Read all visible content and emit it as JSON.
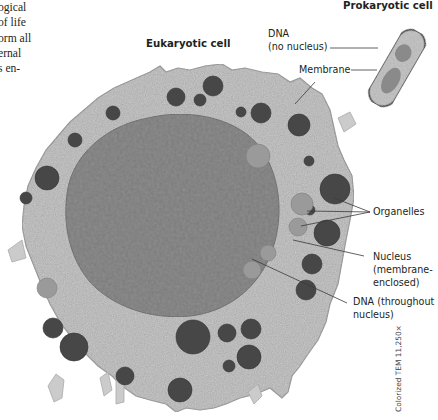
{
  "figure": {
    "body_text_lines": [
      "ogical",
      "of life",
      "orm all",
      "ernal",
      "s en-"
    ],
    "footer_fragment": "t ll   l",
    "titles": {
      "eukaryotic": "Eukaryotic cell",
      "prokaryotic": "Prokaryotic cell"
    },
    "labels": {
      "dna_prokaryote_line1": "DNA",
      "dna_prokaryote_line2": "(no nucleus)",
      "membrane": "Membrane",
      "organelles": "Organelles",
      "nucleus_line1": "Nucleus",
      "nucleus_line2": "(membrane-",
      "nucleus_line3": "enclosed)",
      "dna_eukaryote_line1": "DNA (throughout",
      "dna_eukaryote_line2": "nucleus)"
    },
    "credit": "Colorized TEM 11,250×",
    "colors": {
      "cytoplasm": "#c9c9c9",
      "nucleus": "#8f8f8f",
      "dark_organelle": "#4a4a4a",
      "light_organelle": "#9a9a9a",
      "text": "#231f20",
      "leader_line": "#3a3a3a"
    }
  }
}
